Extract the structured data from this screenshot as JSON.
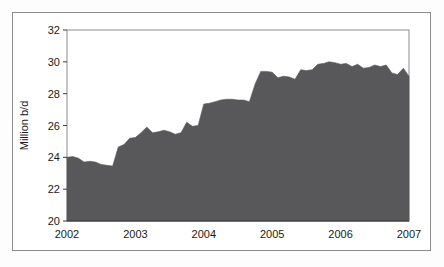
{
  "figure": {
    "background_color": "#ffffff",
    "frame_color": "#8c8c8c"
  },
  "chart_data": {
    "type": "area",
    "title": "",
    "subtitle": "",
    "xlabel": "",
    "ylabel": "Million b/d",
    "series_name": "Production",
    "fill_color": "#58585a",
    "line_color": "#4e4e50",
    "grid": false,
    "legend": "none",
    "xlim": [
      2002.0,
      2007.0
    ],
    "ylim": [
      20,
      32
    ],
    "x_ticks": [
      "2002",
      "2003",
      "2004",
      "2005",
      "2006",
      "2007"
    ],
    "x_tick_values": [
      2002,
      2003,
      2004,
      2005,
      2006,
      2007
    ],
    "y_ticks": [
      "20",
      "22",
      "24",
      "26",
      "28",
      "30",
      "32"
    ],
    "y_tick_values": [
      20,
      22,
      24,
      26,
      28,
      30,
      32
    ],
    "x": [
      2002.0,
      2002.083,
      2002.167,
      2002.25,
      2002.333,
      2002.417,
      2002.5,
      2002.583,
      2002.667,
      2002.75,
      2002.833,
      2002.917,
      2003.0,
      2003.083,
      2003.167,
      2003.25,
      2003.333,
      2003.417,
      2003.5,
      2003.583,
      2003.667,
      2003.75,
      2003.833,
      2003.917,
      2004.0,
      2004.083,
      2004.167,
      2004.25,
      2004.333,
      2004.417,
      2004.5,
      2004.583,
      2004.667,
      2004.75,
      2004.833,
      2004.917,
      2005.0,
      2005.083,
      2005.167,
      2005.25,
      2005.333,
      2005.417,
      2005.5,
      2005.583,
      2005.667,
      2005.75,
      2005.833,
      2005.917,
      2006.0,
      2006.083,
      2006.167,
      2006.25,
      2006.333,
      2006.417,
      2006.5,
      2006.583,
      2006.667,
      2006.75,
      2006.833,
      2006.917,
      2007.0
    ],
    "values": [
      24.0,
      24.05,
      23.95,
      23.7,
      23.75,
      23.7,
      23.55,
      23.5,
      23.45,
      24.65,
      24.8,
      25.2,
      25.25,
      25.55,
      25.9,
      25.55,
      25.6,
      25.7,
      25.6,
      25.45,
      25.55,
      26.2,
      25.95,
      26.0,
      27.35,
      27.4,
      27.5,
      27.6,
      27.65,
      27.65,
      27.6,
      27.6,
      27.5,
      28.6,
      29.4,
      29.4,
      29.35,
      29.0,
      29.1,
      29.05,
      28.9,
      29.5,
      29.45,
      29.5,
      29.85,
      29.9,
      30.0,
      29.95,
      29.85,
      29.9,
      29.7,
      29.85,
      29.6,
      29.65,
      29.8,
      29.7,
      29.8,
      29.3,
      29.2,
      29.6,
      29.1
    ]
  }
}
